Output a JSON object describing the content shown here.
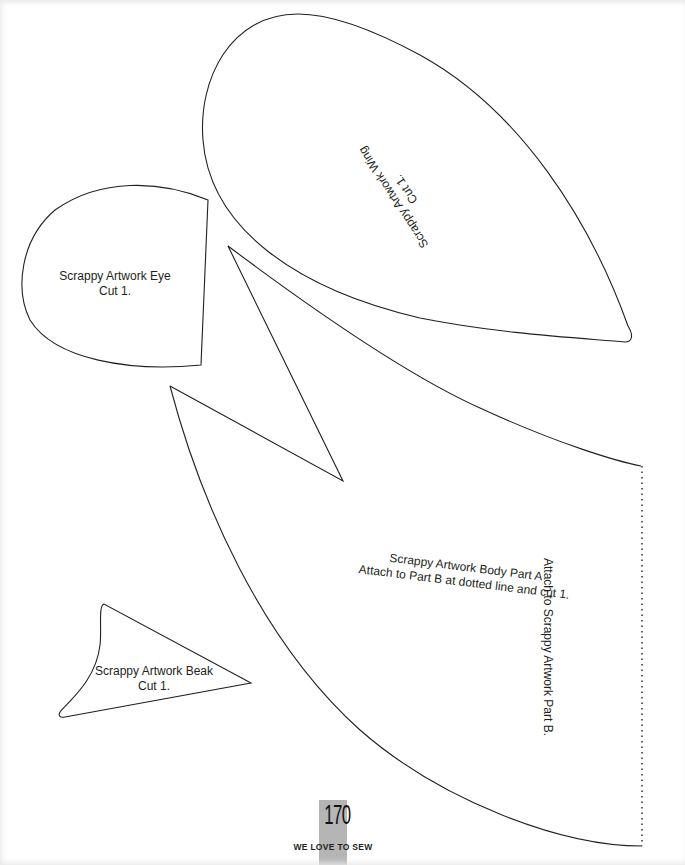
{
  "page": {
    "number": "170",
    "book_title": "WE LOVE TO SEW",
    "tab_color": "#b5b5b5",
    "line_color": "#231f20"
  },
  "pieces": {
    "wing": {
      "name": "Scrappy Artwork Wing",
      "instruction": "Cut 1."
    },
    "eye": {
      "name": "Scrappy Artwork Eye",
      "instruction": "Cut 1."
    },
    "body": {
      "name": "Scrappy Artwork Body Part A",
      "instruction": "Attach to Part B at dotted line and cut 1."
    },
    "beak": {
      "name": "Scrappy Artwork Beak",
      "instruction": "Cut 1."
    },
    "dotted_edge": {
      "label": "Attach to Scrappy Artwork Part B."
    }
  }
}
